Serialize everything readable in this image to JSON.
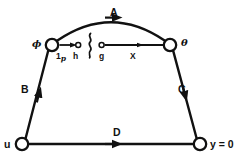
{
  "figure": {
    "type": "diagram",
    "background_color": "#ffffff",
    "stroke_color": "#111111"
  },
  "nodes": [
    {
      "id": "phi",
      "label": "ϕ",
      "label_kind": "greek",
      "x": 52,
      "y": 45,
      "r": 6.2,
      "fill": "#ffffff"
    },
    {
      "id": "theta",
      "label": "θ",
      "label_kind": "greek",
      "x": 170,
      "y": 45,
      "r": 6.2,
      "fill": "#ffffff"
    },
    {
      "id": "u",
      "label": "u",
      "label_kind": "plain",
      "x": 22,
      "y": 144,
      "r": 6.2,
      "fill": "#ffffff"
    },
    {
      "id": "y0",
      "label": "y = 0",
      "label_kind": "plain",
      "x": 200,
      "y": 144,
      "r": 6.2,
      "fill": "#ffffff"
    }
  ],
  "edges": [
    {
      "id": "A",
      "label": "A",
      "from": "phi",
      "to": "theta",
      "shape": "arc-up",
      "arrow_at": "mid"
    },
    {
      "id": "B",
      "label": "B",
      "from": "u",
      "to": "phi",
      "shape": "straight",
      "arrow_at": "mid"
    },
    {
      "id": "C",
      "label": "C",
      "from": "theta",
      "to": "y0",
      "shape": "straight",
      "arrow_at": "mid"
    },
    {
      "id": "D",
      "label": "D",
      "from": "u",
      "to": "y0",
      "shape": "straight",
      "arrow_at": "mid"
    }
  ],
  "inner_arrows": [
    {
      "id": "left-inner",
      "label_main": "1",
      "label_sub": "p",
      "label_target": "h",
      "from_x": 60,
      "to_x": 78,
      "y": 45,
      "target_dot": {
        "x": 78,
        "y": 45,
        "r": 2.4,
        "fill": "#ffffff"
      }
    },
    {
      "id": "right-inner",
      "label_main": "X",
      "label_sub": "",
      "label_source": "g",
      "from_x": 102,
      "to_x": 163,
      "y": 45,
      "source_dot": {
        "x": 102,
        "y": 45,
        "r": 2.4,
        "fill": "#ffffff"
      }
    }
  ],
  "separator": {
    "id": "squiggle",
    "glyph_name": "wavy-line-separator",
    "x": 89,
    "y_top": 33,
    "y_bottom": 58
  },
  "labels": {
    "A": "A",
    "B": "B",
    "C": "C",
    "D": "D",
    "phi": "ϕ",
    "theta": "θ",
    "u": "u",
    "y_zero": "y = 0",
    "one": "1",
    "one_sub": "p",
    "h": "h",
    "g": "g",
    "X": "X"
  }
}
